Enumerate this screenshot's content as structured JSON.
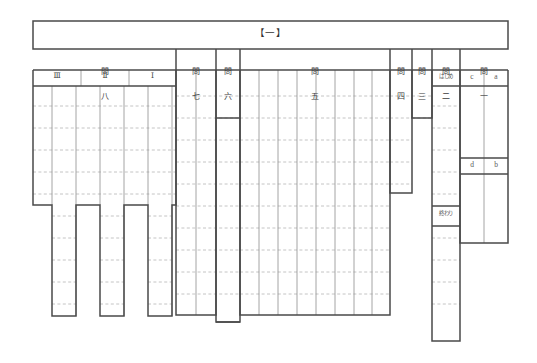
{
  "sheet": {
    "title": "【一】",
    "frame_color": "#4a4a4a",
    "rule_color": "#9a9a9a",
    "dotted_color": "#b4b4b4",
    "text_color": "#3a3a3a"
  },
  "sections": [
    {
      "id": "mon8",
      "heading_top": "問",
      "heading_bottom": "八",
      "subheads": [
        "Ⅲ",
        "Ⅱ",
        "Ⅰ"
      ]
    },
    {
      "id": "mon7",
      "heading_top": "問",
      "heading_bottom": "七",
      "subheads": []
    },
    {
      "id": "mon6",
      "heading_top": "問",
      "heading_bottom": "六",
      "subheads": []
    },
    {
      "id": "mon5",
      "heading_top": "問",
      "heading_bottom": "五",
      "subheads": []
    },
    {
      "id": "mon4",
      "heading_top": "問",
      "heading_bottom": "四",
      "subheads": []
    },
    {
      "id": "mon3",
      "heading_top": "問",
      "heading_bottom": "三",
      "subheads": []
    },
    {
      "id": "mon2",
      "heading_top": "問",
      "heading_bottom": "二",
      "subheads": [],
      "marker_start": "はじめ",
      "marker_end": "終わり"
    },
    {
      "id": "mon1",
      "heading_top": "問",
      "heading_bottom": "一",
      "subheads": [],
      "letters_row1": [
        "c",
        "a"
      ],
      "letters_row2": [
        "d",
        "b"
      ]
    }
  ],
  "letters": {
    "c": "c",
    "a": "a",
    "d": "d",
    "b": "b"
  },
  "markers": {
    "hajime": "はじめ",
    "owari": "終わり"
  }
}
